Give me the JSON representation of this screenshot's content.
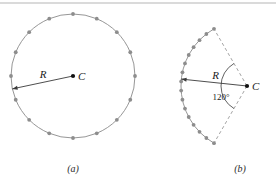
{
  "figure": {
    "background_color": "#ffffff",
    "top_rule_color": "#b6b6b6",
    "curve_color": "#8a8a8a",
    "dash_color": "#9a9a9a",
    "bead_color": "#8d8d8d",
    "line_color": "#3a3a3a",
    "text_color": "#1a1a1a"
  },
  "panel_a": {
    "caption": "(a)",
    "radius_label": "R",
    "center_label": "C",
    "center": {
      "x": 73,
      "y": 76
    },
    "radius": 62,
    "bead_count": 16,
    "bead_start_angle_deg": -90,
    "radius_line": {
      "from": {
        "x": 73,
        "y": 76
      },
      "to_angle_deg": 168
    },
    "caption_pos": {
      "x": 73,
      "y": 172
    }
  },
  "panel_b": {
    "caption": "(b)",
    "radius_label": "R",
    "center_label": "C",
    "angle_label": "120°",
    "vertex": {
      "x": 247,
      "y": 86
    },
    "radius": 66,
    "sector_angle_deg": 120,
    "bead_count": 16,
    "arc_start_angle_deg": 120,
    "arc_end_angle_deg": 240,
    "dashed_radii": true,
    "angle_arc_radius": 26,
    "caption_pos": {
      "x": 240,
      "y": 172
    }
  }
}
